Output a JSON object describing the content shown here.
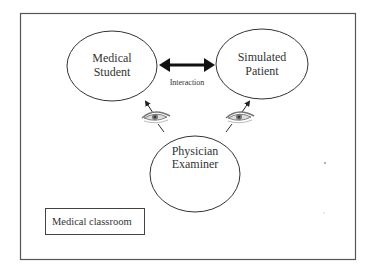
{
  "diagram": {
    "nodes": {
      "student": {
        "line1": "Medical",
        "line2": "Student"
      },
      "patient": {
        "line1": "Simulated",
        "line2": "Patient"
      },
      "examiner": {
        "line1": "Physician",
        "line2": "Examiner"
      }
    },
    "edge_label": "Interaction",
    "classroom_label": "Medical classroom",
    "icons": {
      "left_eye": "eye-icon",
      "right_eye": "eye-icon"
    },
    "colors": {
      "stroke": "#333333",
      "frame": "#555555",
      "background": "#ffffff",
      "eye": "#888888"
    }
  }
}
